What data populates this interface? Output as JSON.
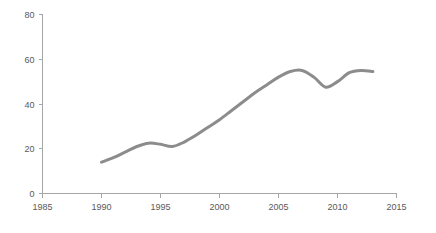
{
  "chart_data": {
    "type": "line",
    "title": "",
    "subtitle": "",
    "xlabel": "",
    "ylabel": "",
    "xlim": [
      1985,
      2015
    ],
    "ylim": [
      0,
      80
    ],
    "grid": false,
    "legend": null,
    "legend_position": "none",
    "line_color": "#8c8c8c",
    "axis_color": "#a6a6a6",
    "tick_label_color": "#595959",
    "xticks": [
      1985,
      1990,
      1995,
      2000,
      2005,
      2010,
      2015
    ],
    "xtick_labels": [
      "1985",
      "1990",
      "1995",
      "2000",
      "2005",
      "2010",
      "2015"
    ],
    "yticks": [
      0,
      20,
      40,
      60,
      80
    ],
    "ytick_labels": [
      "0",
      "20",
      "40",
      "60",
      "80"
    ],
    "series": [
      {
        "name": "",
        "x": [
          1990,
          1991,
          1992,
          1993,
          1994,
          1995,
          1996,
          1997,
          1998,
          1999,
          2000,
          2001,
          2002,
          2003,
          2004,
          2005,
          2006,
          2007,
          2008,
          2009,
          2010,
          2011,
          2012,
          2013
        ],
        "values": [
          14.0,
          16.0,
          18.5,
          21.0,
          22.5,
          22.0,
          21.0,
          23.0,
          26.0,
          29.5,
          33.0,
          37.0,
          41.0,
          45.0,
          48.5,
          52.0,
          54.5,
          55.0,
          52.0,
          47.5,
          50.0,
          54.0,
          55.0,
          54.5
        ]
      }
    ]
  }
}
